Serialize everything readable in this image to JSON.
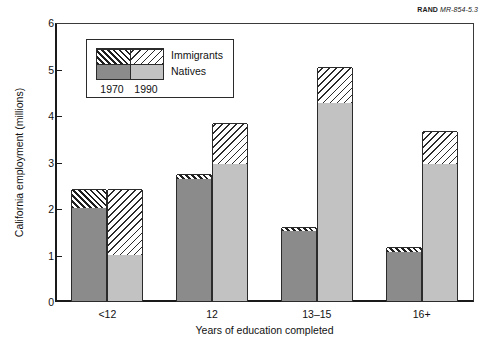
{
  "source_credit": {
    "organization": "RAND",
    "code": "MR-854-5.3"
  },
  "chart_data": {
    "type": "bar",
    "subtype": "grouped-stacked",
    "title": "",
    "xlabel": "Years of education completed",
    "ylabel": "California employment (millions)",
    "categories": [
      "<12",
      "12",
      "13–15",
      "16+"
    ],
    "ylim": [
      0,
      6
    ],
    "yticks": [
      0,
      1,
      2,
      3,
      4,
      5,
      6
    ],
    "ytick_labels": [
      "0",
      "1",
      "2",
      "3",
      "4",
      "5",
      "6"
    ],
    "grid": false,
    "legend": {
      "position": "upper-left-inside",
      "series_labels": [
        "Immigrants",
        "Natives"
      ],
      "group_labels": [
        "1970",
        "1990"
      ]
    },
    "groups": [
      {
        "year": "1970",
        "series": [
          {
            "name": "Natives",
            "values": [
              2.0,
              2.62,
              1.5,
              1.05
            ]
          },
          {
            "name": "Immigrants",
            "values": [
              0.41,
              0.11,
              0.1,
              0.11
            ]
          }
        ],
        "totals": [
          2.41,
          2.73,
          1.6,
          1.16
        ]
      },
      {
        "year": "1990",
        "series": [
          {
            "name": "Natives",
            "values": [
              1.0,
              2.95,
              4.25,
              2.95
            ]
          },
          {
            "name": "Immigrants",
            "values": [
              1.41,
              0.88,
              0.78,
              0.71
            ]
          }
        ],
        "totals": [
          2.41,
          3.83,
          5.03,
          3.66
        ]
      }
    ]
  }
}
